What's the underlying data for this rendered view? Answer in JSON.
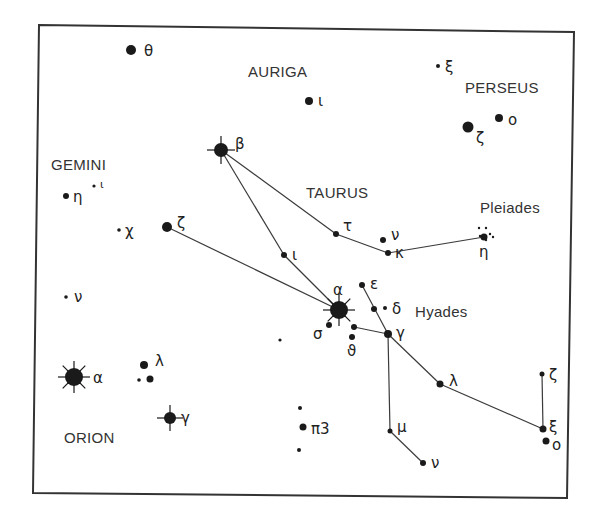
{
  "colors": {
    "ink": "#1a1a1a",
    "line": "#3a3a3a",
    "border": "#333333",
    "background": "#ffffff"
  },
  "frame": {
    "points": [
      [
        39,
        25
      ],
      [
        574,
        32
      ],
      [
        567,
        498
      ],
      [
        33,
        493
      ]
    ]
  },
  "constellations": [
    {
      "name": "AURIGA",
      "x": 248,
      "y": 77
    },
    {
      "name": "PERSEUS",
      "x": 465,
      "y": 93
    },
    {
      "name": "GEMINI",
      "x": 51,
      "y": 170
    },
    {
      "name": "TAURUS",
      "x": 306,
      "y": 198
    },
    {
      "name": "ORION",
      "x": 64,
      "y": 443
    }
  ],
  "clusters": [
    {
      "name": "Pleiades",
      "x": 480,
      "y": 213
    },
    {
      "name": "Hyades",
      "x": 415,
      "y": 317
    }
  ],
  "stars": [
    {
      "id": "gem-theta",
      "label": "θ",
      "x": 131,
      "y": 50,
      "r": 5,
      "lx": 144,
      "ly": 56
    },
    {
      "id": "gem-eta",
      "label": "η",
      "x": 66,
      "y": 196,
      "r": 3,
      "lx": 73,
      "ly": 202
    },
    {
      "id": "gem-iota",
      "label": "ι",
      "x": 94,
      "y": 186,
      "r": 1.6,
      "lx": 100,
      "ly": 188
    },
    {
      "id": "gem-chi",
      "label": "χ",
      "x": 119,
      "y": 230,
      "r": 1.8,
      "lx": 125,
      "ly": 236
    },
    {
      "id": "gem-zeta",
      "label": "ζ",
      "x": 167,
      "y": 227,
      "r": 5,
      "lx": 177,
      "ly": 228
    },
    {
      "id": "gem-nu",
      "label": "ν",
      "x": 66,
      "y": 297,
      "r": 1.8,
      "lx": 74,
      "ly": 302
    },
    {
      "id": "aur-beta",
      "label": "β",
      "x": 221,
      "y": 150,
      "r": 7,
      "rays": true,
      "lx": 235,
      "ly": 149
    },
    {
      "id": "aur-iota",
      "label": "ι",
      "x": 309,
      "y": 101,
      "r": 4,
      "lx": 318,
      "ly": 106
    },
    {
      "id": "per-xi",
      "label": "ξ",
      "x": 438,
      "y": 66,
      "r": 2,
      "lx": 445,
      "ly": 72
    },
    {
      "id": "per-zeta",
      "label": "ζ",
      "x": 468,
      "y": 127,
      "r": 5.5,
      "lx": 476,
      "ly": 143
    },
    {
      "id": "per-omicron",
      "label": "o",
      "x": 499,
      "y": 118,
      "r": 4,
      "lx": 508,
      "ly": 125
    },
    {
      "id": "tau-alpha",
      "label": "α",
      "x": 339,
      "y": 310,
      "r": 9,
      "rays": true,
      "lx": 333,
      "ly": 295
    },
    {
      "id": "tau-iota",
      "label": "ι",
      "x": 284,
      "y": 255,
      "r": 3,
      "lx": 292,
      "ly": 260
    },
    {
      "id": "tau-tau",
      "label": "τ",
      "x": 336,
      "y": 234,
      "r": 3,
      "lx": 343,
      "ly": 231
    },
    {
      "id": "tau-nu",
      "label": "ν",
      "x": 383,
      "y": 240,
      "r": 3,
      "lx": 391,
      "ly": 240
    },
    {
      "id": "tau-kappa",
      "label": "κ",
      "x": 388,
      "y": 253,
      "r": 3,
      "lx": 395,
      "ly": 258
    },
    {
      "id": "tau-eta",
      "label": "η",
      "x": 484,
      "y": 237,
      "r": 3.5,
      "lx": 479,
      "ly": 257
    },
    {
      "id": "tau-epsilon",
      "label": "ε",
      "x": 362,
      "y": 285,
      "r": 3,
      "lx": 370,
      "ly": 289
    },
    {
      "id": "tau-delta1",
      "label": "",
      "x": 374,
      "y": 309,
      "r": 3,
      "lx": 0,
      "ly": 0
    },
    {
      "id": "tau-delta",
      "label": "δ",
      "x": 385,
      "y": 308,
      "r": 2,
      "lx": 392,
      "ly": 314
    },
    {
      "id": "tau-gamma",
      "label": "γ",
      "x": 388,
      "y": 334,
      "r": 4,
      "lx": 396,
      "ly": 338
    },
    {
      "id": "tau-sigma",
      "label": "σ",
      "x": 329,
      "y": 325,
      "r": 3,
      "lx": 313,
      "ly": 339
    },
    {
      "id": "tau-theta1",
      "label": "",
      "x": 354,
      "y": 327,
      "r": 3,
      "lx": 0,
      "ly": 0
    },
    {
      "id": "tau-theta2",
      "label": "ϑ",
      "x": 352,
      "y": 337,
      "r": 3,
      "lx": 347,
      "ly": 356
    },
    {
      "id": "tau-lambda",
      "label": "λ",
      "x": 440,
      "y": 384,
      "r": 3.5,
      "lx": 449,
      "ly": 386
    },
    {
      "id": "tau-mu",
      "label": "μ",
      "x": 390,
      "y": 431,
      "r": 2.5,
      "lx": 397,
      "ly": 432
    },
    {
      "id": "tau-nu2",
      "label": "ν",
      "x": 423,
      "y": 463,
      "r": 3,
      "lx": 431,
      "ly": 468
    },
    {
      "id": "tau-zeta",
      "label": "ζ",
      "x": 542,
      "y": 374,
      "r": 2.5,
      "lx": 549,
      "ly": 380
    },
    {
      "id": "tau-xi",
      "label": "ξ",
      "x": 543,
      "y": 429,
      "r": 3.5,
      "lx": 549,
      "ly": 432
    },
    {
      "id": "tau-omicron",
      "label": "o",
      "x": 546,
      "y": 441,
      "r": 3.5,
      "lx": 552,
      "ly": 450
    },
    {
      "id": "field-dot",
      "label": "",
      "x": 280,
      "y": 340,
      "r": 1.6,
      "lx": 0,
      "ly": 0
    },
    {
      "id": "ori-pi-upper",
      "label": "",
      "x": 300,
      "y": 408,
      "r": 2,
      "lx": 0,
      "ly": 0
    },
    {
      "id": "ori-pi3",
      "label": "π3",
      "x": 303,
      "y": 427,
      "r": 3.5,
      "lx": 311,
      "ly": 434
    },
    {
      "id": "ori-pi-lower",
      "label": "",
      "x": 299,
      "y": 450,
      "r": 2,
      "lx": 0,
      "ly": 0
    },
    {
      "id": "ori-alpha",
      "label": "α",
      "x": 74,
      "y": 377,
      "r": 9,
      "rays": true,
      "lx": 93,
      "ly": 383
    },
    {
      "id": "ori-lambda",
      "label": "λ",
      "x": 144,
      "y": 365,
      "r": 4,
      "lx": 155,
      "ly": 366
    },
    {
      "id": "ori-phi1",
      "label": "",
      "x": 139,
      "y": 380,
      "r": 1.8,
      "lx": 0,
      "ly": 0
    },
    {
      "id": "ori-phi2",
      "label": "",
      "x": 150,
      "y": 379,
      "r": 3.5,
      "lx": 0,
      "ly": 0
    },
    {
      "id": "ori-gamma",
      "label": "γ",
      "x": 170,
      "y": 418,
      "r": 6,
      "rays": true,
      "lx": 181,
      "ly": 423
    }
  ],
  "pleiades_dots": [
    [
      479,
      228
    ],
    [
      486,
      228
    ],
    [
      490,
      234
    ],
    [
      493,
      237
    ],
    [
      480,
      236
    ],
    [
      486,
      240
    ]
  ],
  "lines": [
    [
      "aur-beta",
      "tau-tau"
    ],
    [
      "tau-tau",
      "tau-kappa"
    ],
    [
      "tau-kappa",
      "tau-eta"
    ],
    [
      "aur-beta",
      "tau-iota"
    ],
    [
      "tau-iota",
      "tau-alpha"
    ],
    [
      "gem-zeta",
      "tau-alpha"
    ],
    [
      "tau-epsilon",
      "tau-gamma"
    ],
    [
      "tau-theta1",
      "tau-gamma"
    ],
    [
      "tau-gamma",
      "tau-lambda"
    ],
    [
      "tau-lambda",
      "tau-xi"
    ],
    [
      "tau-zeta",
      "tau-xi"
    ],
    [
      "tau-gamma",
      "tau-mu"
    ],
    [
      "tau-mu",
      "tau-nu2"
    ]
  ]
}
